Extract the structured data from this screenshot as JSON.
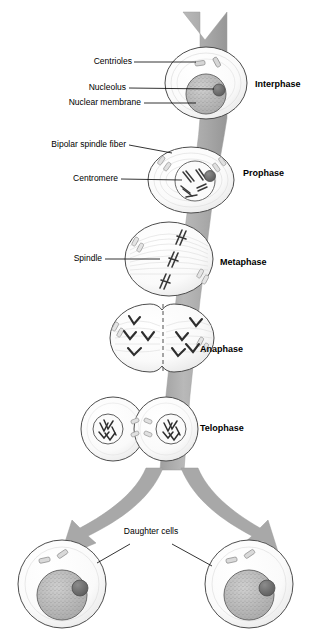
{
  "diagram": {
    "colors": {
      "band": "#a6a6a6",
      "band_light": "#bdbdbd",
      "cell_outline": "#4d4d4d",
      "nucleus_fill": "#b8b8b8",
      "nucleolus": "#6e6e6e",
      "chromosome": "#3a3a3a",
      "leader_line": "#000000",
      "background": "#ffffff"
    }
  },
  "left_labels": [
    {
      "id": "centrioles",
      "text": "Centrioles"
    },
    {
      "id": "nucleolus",
      "text": "Nucleolus"
    },
    {
      "id": "nuclear-membrane",
      "text": "Nuclear membrane"
    },
    {
      "id": "bipolar-spindle-fiber",
      "text": "Bipolar spindle fiber"
    },
    {
      "id": "centromere",
      "text": "Centromere"
    },
    {
      "id": "spindle",
      "text": "Spindle"
    }
  ],
  "phase_labels": [
    {
      "id": "interphase",
      "text": "Interphase"
    },
    {
      "id": "prophase",
      "text": "Prophase"
    },
    {
      "id": "metaphase",
      "text": "Metaphase"
    },
    {
      "id": "anaphase",
      "text": "Anaphase"
    },
    {
      "id": "telophase",
      "text": "Telophase"
    }
  ],
  "bottom_label": {
    "id": "daughter-cells",
    "text": "Daughter cells"
  }
}
